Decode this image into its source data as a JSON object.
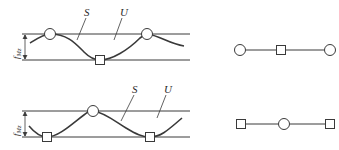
{
  "figure": {
    "top_panel": {
      "labels": {
        "curve": "S",
        "band": "U",
        "dimension": "f_Mz",
        "dimension_main": "f",
        "dimension_sub": "Mz"
      },
      "node_sequence": [
        "circle",
        "square",
        "circle"
      ]
    },
    "bottom_panel": {
      "labels": {
        "curve": "S",
        "band": "U",
        "dimension": "f_Mz",
        "dimension_main": "f",
        "dimension_sub": "Mz"
      },
      "node_sequence": [
        "square",
        "circle",
        "square"
      ]
    },
    "colors": {
      "stroke": "#3a3a3a",
      "background": "#ffffff"
    }
  }
}
